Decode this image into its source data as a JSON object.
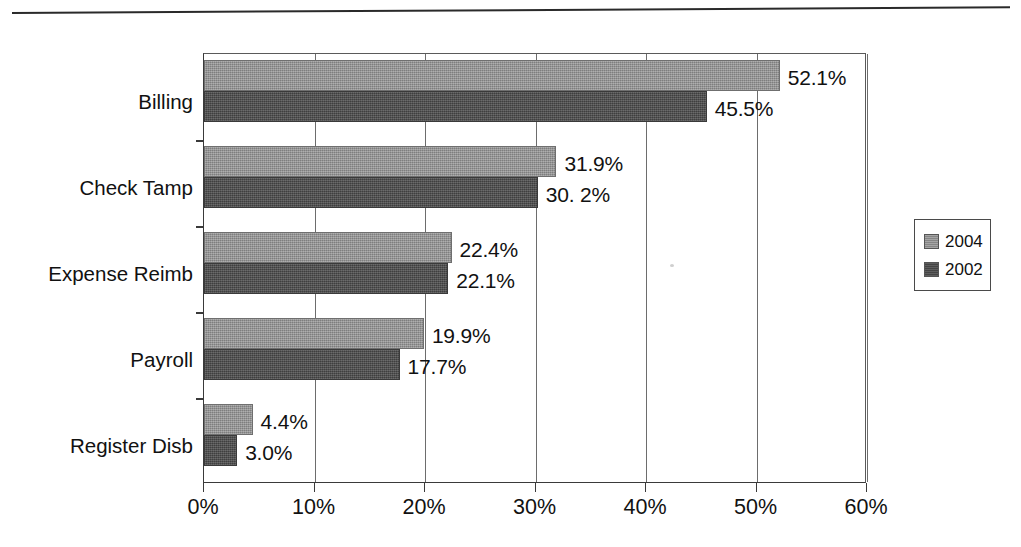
{
  "chart_data": {
    "type": "bar",
    "orientation": "horizontal",
    "title": "",
    "subtitle": "",
    "xlabel": "",
    "ylabel": "",
    "xlim": [
      0,
      60
    ],
    "xtick_labels": [
      "0%",
      "10%",
      "20%",
      "30%",
      "40%",
      "50%",
      "60%"
    ],
    "xtick_values": [
      0,
      10,
      20,
      30,
      40,
      50,
      60
    ],
    "grid": "vertical",
    "legend_position": "right",
    "categories": [
      "Billing",
      "Check Tamp",
      "Expense Reimb",
      "Payroll",
      "Register Disb"
    ],
    "series": [
      {
        "name": "2004",
        "color": "#8c8c8c",
        "values": [
          52.1,
          31.9,
          22.4,
          19.9,
          4.4
        ],
        "labels": [
          "52.1%",
          "31.9%",
          "22.4%",
          "19.9%",
          "4.4%"
        ]
      },
      {
        "name": "2002",
        "color": "#4c4c4c",
        "values": [
          45.5,
          30.2,
          22.1,
          17.7,
          3.0
        ],
        "labels": [
          "45.5%",
          "30. 2%",
          "22.1%",
          "17.7%",
          "3.0%"
        ]
      }
    ]
  },
  "legend": {
    "entries": [
      {
        "label": "2004",
        "swatch": "legend-swatch-2004"
      },
      {
        "label": "2002",
        "swatch": "legend-swatch-2002"
      }
    ]
  },
  "colors": {
    "series_2004": "#8c8c8c",
    "series_2002": "#4c4c4c",
    "axis": "#3a3a3a",
    "gridline": "#6d6d6d",
    "background": "#ffffff",
    "text": "#111111"
  }
}
